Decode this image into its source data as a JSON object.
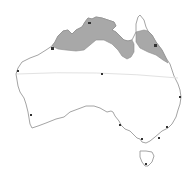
{
  "map": {
    "subject": "Australia distribution map",
    "colors": {
      "background": "#ffffff",
      "coastline": "#9a9a9a",
      "range_fill": "#a8a8a8",
      "range_edge": "#8c8c8c",
      "tropic_line": "#e2e2e2",
      "city_dot": "#333333"
    },
    "range_regions": [
      {
        "name": "northern-tropics-range",
        "area": "Kimberley, Top End, Gulf coast"
      },
      {
        "name": "cape-york-range",
        "area": "Cape York Peninsula east coast"
      }
    ],
    "reference_lines": [
      {
        "name": "tropic-of-capricorn"
      }
    ],
    "markers_count": 12
  }
}
